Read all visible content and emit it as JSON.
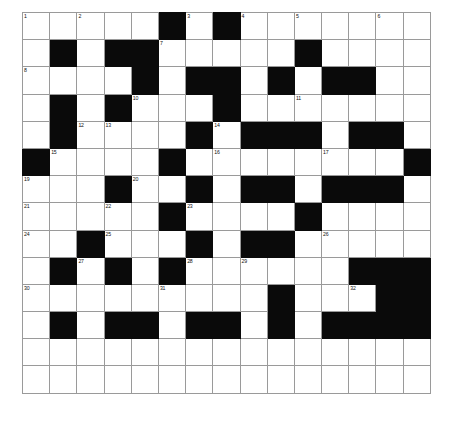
{
  "puzzle": {
    "kind": "crossword-grid",
    "title": "",
    "rows": 14,
    "cols": 15,
    "cell_size_px": 27.2,
    "colors": {
      "block": "#0a0a0a",
      "open": "#ffffff",
      "grid_line": "#9a9a9a",
      "number_text": "#111111",
      "page_background": "#ffffff"
    },
    "legend": {
      "block_code": 1,
      "open_code": 0
    },
    "max_clue_number": 32,
    "clue_numbers_visible": [
      1,
      2,
      3,
      4,
      5,
      6,
      7,
      8,
      9,
      10,
      11,
      12,
      13,
      14,
      15,
      16,
      17,
      18,
      19,
      20,
      21,
      22,
      23,
      24,
      25,
      26,
      27,
      28,
      29,
      30,
      31,
      32
    ],
    "blocks": [
      [
        0,
        0,
        0,
        0,
        0,
        1,
        0,
        1,
        0,
        0,
        0,
        0,
        0,
        0,
        0
      ],
      [
        0,
        1,
        0,
        1,
        1,
        0,
        0,
        0,
        0,
        0,
        1,
        0,
        0,
        0,
        0
      ],
      [
        0,
        0,
        0,
        0,
        1,
        0,
        1,
        1,
        0,
        1,
        0,
        1,
        1,
        0,
        0
      ],
      [
        0,
        1,
        0,
        1,
        0,
        0,
        0,
        1,
        0,
        0,
        0,
        0,
        0,
        0,
        0
      ],
      [
        0,
        1,
        0,
        0,
        0,
        0,
        1,
        0,
        1,
        1,
        1,
        0,
        1,
        1,
        0
      ],
      [
        1,
        0,
        0,
        0,
        0,
        1,
        0,
        0,
        0,
        0,
        0,
        0,
        0,
        0,
        1
      ],
      [
        0,
        0,
        0,
        1,
        0,
        0,
        1,
        0,
        1,
        1,
        0,
        1,
        1,
        1,
        0
      ],
      [
        0,
        0,
        0,
        0,
        0,
        1,
        0,
        0,
        0,
        0,
        1,
        0,
        0,
        0,
        0
      ],
      [
        0,
        0,
        1,
        0,
        0,
        0,
        1,
        0,
        1,
        1,
        0,
        0,
        0,
        0,
        0
      ],
      [
        0,
        1,
        0,
        1,
        0,
        1,
        0,
        0,
        0,
        0,
        0,
        0,
        1,
        1,
        1
      ],
      [
        0,
        0,
        0,
        0,
        0,
        0,
        0,
        0,
        0,
        1,
        0,
        0,
        0,
        1,
        1
      ],
      [
        0,
        1,
        0,
        1,
        1,
        0,
        1,
        1,
        0,
        1,
        0,
        1,
        1,
        1,
        1
      ],
      [
        0,
        0,
        0,
        0,
        0,
        0,
        0,
        0,
        0,
        0,
        0,
        0,
        0,
        0,
        0
      ],
      [
        0,
        0,
        0,
        0,
        0,
        0,
        0,
        0,
        0,
        0,
        0,
        0,
        0,
        0,
        0
      ]
    ],
    "numbered_cells": [
      {
        "num": 1,
        "row": 0,
        "col": 0
      },
      {
        "num": 2,
        "row": 0,
        "col": 2
      },
      {
        "num": 3,
        "row": 0,
        "col": 6
      },
      {
        "num": 4,
        "row": 0,
        "col": 8
      },
      {
        "num": 5,
        "row": 0,
        "col": 10
      },
      {
        "num": 6,
        "row": 0,
        "col": 13
      },
      {
        "num": 7,
        "row": 1,
        "col": 5
      },
      {
        "num": 8,
        "row": 2,
        "col": 0
      },
      {
        "num": 9,
        "row": 2,
        "col": 12
      },
      {
        "num": 10,
        "row": 3,
        "col": 4
      },
      {
        "num": 11,
        "row": 3,
        "col": 10
      },
      {
        "num": 12,
        "row": 4,
        "col": 2
      },
      {
        "num": 13,
        "row": 4,
        "col": 3
      },
      {
        "num": 14,
        "row": 4,
        "col": 7
      },
      {
        "num": 15,
        "row": 5,
        "col": 1
      },
      {
        "num": 16,
        "row": 5,
        "col": 7
      },
      {
        "num": 17,
        "row": 5,
        "col": 11
      },
      {
        "num": 18,
        "row": 5,
        "col": 14
      },
      {
        "num": 19,
        "row": 6,
        "col": 0
      },
      {
        "num": 20,
        "row": 6,
        "col": 4
      },
      {
        "num": 21,
        "row": 7,
        "col": 0
      },
      {
        "num": 22,
        "row": 7,
        "col": 3
      },
      {
        "num": 23,
        "row": 7,
        "col": 6
      },
      {
        "num": 24,
        "row": 8,
        "col": 0
      },
      {
        "num": 25,
        "row": 8,
        "col": 3
      },
      {
        "num": 26,
        "row": 8,
        "col": 11
      },
      {
        "num": 27,
        "row": 9,
        "col": 2
      },
      {
        "num": 28,
        "row": 9,
        "col": 6
      },
      {
        "num": 29,
        "row": 9,
        "col": 8
      },
      {
        "num": 30,
        "row": 10,
        "col": 0
      },
      {
        "num": 31,
        "row": 10,
        "col": 5
      },
      {
        "num": 32,
        "row": 10,
        "col": 12
      }
    ],
    "letters": []
  }
}
